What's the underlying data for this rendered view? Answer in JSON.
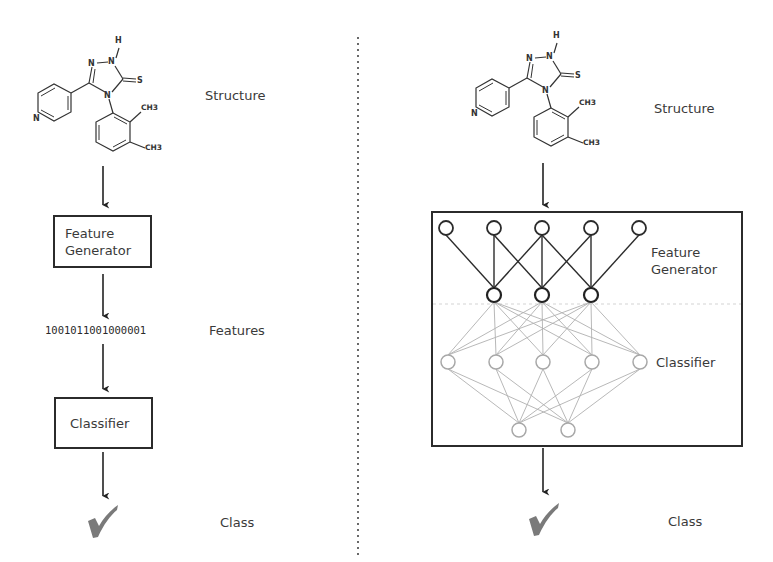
{
  "left_panel": {
    "structure_label": "Structure",
    "feature_generator_label_line1": "Feature",
    "feature_generator_label_line2": "Generator",
    "features_bits": "1001011001000001",
    "features_label": "Features",
    "classifier_label": "Classifier",
    "class_label": "Class"
  },
  "right_panel": {
    "structure_label": "Structure",
    "feature_generator_label_line1": "Feature",
    "feature_generator_label_line2": "Generator",
    "classifier_label": "Classifier",
    "class_label": "Class"
  },
  "molecule": {
    "atoms": {
      "h": "H",
      "n_top_right": "N",
      "n_top_left": "N",
      "n4": "N",
      "s": "S",
      "n_pyridine": "N",
      "ch3_a": "CH3",
      "ch3_b": "CH3"
    }
  },
  "network": {
    "input_layer_nodes": 5,
    "feature_layer_nodes": 3,
    "hidden_layer_nodes": 5,
    "output_layer_nodes": 2
  },
  "icons": {
    "result": "checkmark-icon",
    "flow": "arrow-down-icon"
  },
  "colors": {
    "line_dark": "#2b2b2b",
    "line_gray": "#a8a8a8",
    "check_gray": "#7a7a7a",
    "divider": "#444444"
  }
}
